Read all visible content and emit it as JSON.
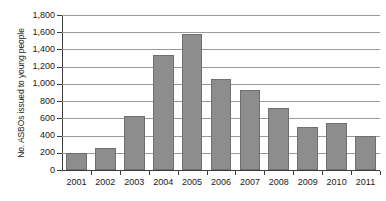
{
  "chart_data": {
    "type": "bar",
    "title": "",
    "subtitle": "",
    "xlabel": "",
    "ylabel": "No. ASBOs issued to young people",
    "categories": [
      "2001",
      "2002",
      "2003",
      "2004",
      "2005",
      "2006",
      "2007",
      "2008",
      "2009",
      "2010",
      "2011"
    ],
    "values": [
      200,
      260,
      630,
      1340,
      1580,
      1060,
      925,
      725,
      505,
      550,
      390
    ],
    "series": [
      {
        "name": "No. ASBOs issued to young people",
        "values": [
          200,
          260,
          630,
          1340,
          1580,
          1060,
          925,
          725,
          505,
          550,
          390
        ]
      }
    ],
    "ylim": [
      0,
      1800
    ],
    "ytick_step": 200,
    "ytick_labels": [
      "0",
      "200",
      "400",
      "600",
      "800",
      "1,000",
      "1,200",
      "1,400",
      "1,600",
      "1,800"
    ],
    "ytick_values": [
      0,
      200,
      400,
      600,
      800,
      1000,
      1200,
      1400,
      1600,
      1800
    ],
    "grid": true,
    "grid_axis": "y",
    "legend": false,
    "legend_position": "none",
    "bar_color": "#8d8d8d",
    "bar_edge_color": "#6f6f6f",
    "grid_color": "#9a9a9a",
    "axis_color": "#3d3d3d",
    "background_color": "#ffffff",
    "annotations": []
  }
}
